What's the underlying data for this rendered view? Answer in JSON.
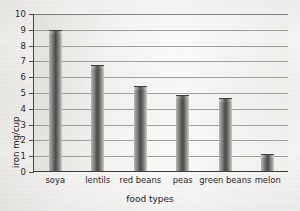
{
  "chart_data": {
    "type": "bar",
    "title": "",
    "xlabel": "food types",
    "ylabel": "iron mg/cup",
    "categories": [
      "soya",
      "lentils",
      "red beans",
      "peas",
      "green beans",
      "melon"
    ],
    "values": [
      8.85,
      6.65,
      5.3,
      4.75,
      4.55,
      1.0
    ],
    "ylim": [
      0,
      10
    ],
    "ytick_labels": [
      "0",
      "1",
      "2",
      "3",
      "4",
      "5",
      "6",
      "7",
      "8",
      "9",
      "10"
    ],
    "ytick_values": [
      0,
      1,
      2,
      3,
      4,
      5,
      6,
      7,
      8,
      9,
      10
    ],
    "grid": "horizontal",
    "legend": "none",
    "bar_color": "#4e4c4b",
    "axis_color": "#3c3c3c",
    "gridline_color": "#8f8f8d",
    "background_color": "#f2f1ef"
  }
}
